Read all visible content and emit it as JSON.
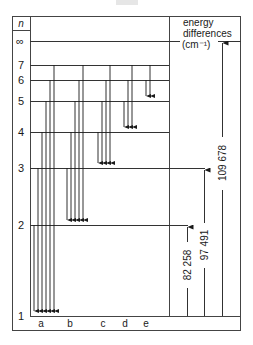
{
  "header": {
    "n_label": "n",
    "right_title_line1": "energy",
    "right_title_line2": "differences",
    "right_title_line3": "(cm⁻¹)"
  },
  "levels": [
    {
      "label": "∞",
      "y": 41
    },
    {
      "label": "7",
      "y": 65
    },
    {
      "label": "6",
      "y": 80
    },
    {
      "label": "5",
      "y": 101
    },
    {
      "label": "4",
      "y": 132
    },
    {
      "label": "3",
      "y": 168
    },
    {
      "label": "2",
      "y": 225
    },
    {
      "label": "1",
      "y": 316
    }
  ],
  "series": [
    {
      "label": "a",
      "lower_n": 1,
      "label_x": 40
    },
    {
      "label": "b",
      "lower_n": 2,
      "label_x": 70
    },
    {
      "label": "c",
      "lower_n": 3,
      "label_x": 103
    },
    {
      "label": "d",
      "lower_n": 4,
      "label_x": 125
    },
    {
      "label": "e",
      "lower_n": 5,
      "label_x": 146
    }
  ],
  "energy_differences": [
    {
      "label": "82 258",
      "from_n": 1,
      "to_n": 2
    },
    {
      "label": "97 491",
      "from_n": 1,
      "to_n": 3
    },
    {
      "label": "109 678",
      "from_n": 1,
      "to_n": "∞"
    }
  ],
  "colors": {
    "line": "#2a2a2a",
    "frame": "#444444"
  }
}
